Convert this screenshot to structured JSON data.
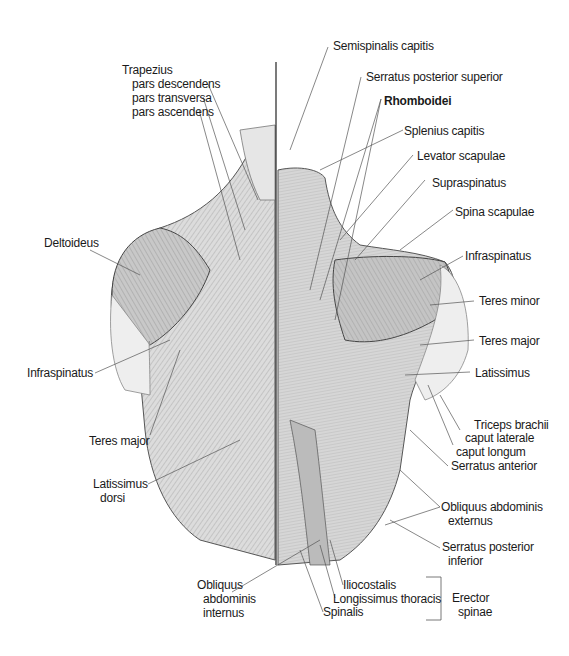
{
  "figure": {
    "left_labels": {
      "trapezius": "Trapezius",
      "trapezius_desc": "pars descendens",
      "trapezius_trans": "pars transversa",
      "trapezius_asc": "pars ascendens",
      "deltoideus": "Deltoideus",
      "infraspinatus": "Infraspinatus",
      "teres_major": "Teres major",
      "latissimus_1": "Latissimus",
      "latissimus_2": "dorsi",
      "obliquus_int_1": "Obliquus",
      "obliquus_int_2": "abdominis",
      "obliquus_int_3": "internus"
    },
    "right_labels": {
      "semispinalis": "Semispinalis capitis",
      "serratus_sup": "Serratus posterior superior",
      "rhomboidei": "Rhomboidei",
      "splenius": "Splenius capitis",
      "levator": "Levator scapulae",
      "supraspinatus": "Supraspinatus",
      "spina": "Spina scapulae",
      "infraspinatus": "Infraspinatus",
      "teres_minor": "Teres minor",
      "teres_major": "Teres major",
      "latissimus": "Latissimus",
      "triceps_1": "Triceps brachii",
      "triceps_2": "caput laterale",
      "triceps_3": "caput longum",
      "serratus_ant": "Serratus anterior",
      "obliquus_ext_1": "Obliquus abdominis",
      "obliquus_ext_2": "externus",
      "serratus_inf_1": "Serratus posterior",
      "serratus_inf_2": "inferior"
    },
    "bottom_labels": {
      "iliocostalis": "Iliocostalis",
      "longissimus": "Longissimus thoracis",
      "spinalis": "Spinalis",
      "erector_1": "Erector",
      "erector_2": "spinae"
    }
  }
}
